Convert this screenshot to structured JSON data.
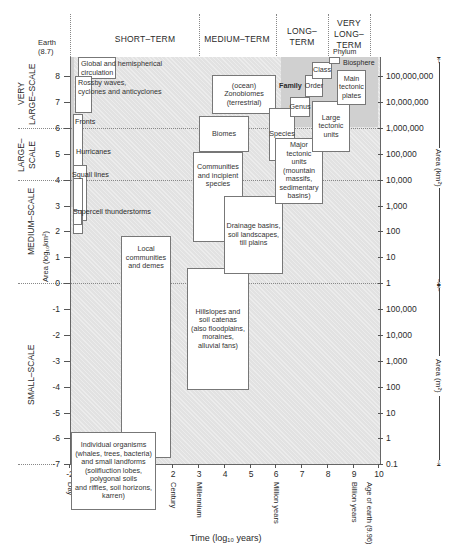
{
  "periods": [
    {
      "label": "SHORT–TERM"
    },
    {
      "label": "MEDIUM–TERM"
    },
    {
      "label": "LONG–\nTERM"
    },
    {
      "label": "VERY\nLONG–\nTERM"
    }
  ],
  "spatial_scales": [
    {
      "label": "VERY\nLARGE–SCALE"
    },
    {
      "label": "LARGE–\nSCALE"
    },
    {
      "label": "MEDIUM–SCALE"
    },
    {
      "label": "SMALL–SCALE"
    }
  ],
  "y_axis": {
    "label": "Area (log₁₀km²)",
    "top_marker": "Earth\n(8.7)",
    "ticks": [
      "8",
      "7",
      "6",
      "5",
      "4",
      "3",
      "2",
      "1",
      "0",
      "-1",
      "-2",
      "-3",
      "-4",
      "-5",
      "-6",
      "-7"
    ]
  },
  "x_axis": {
    "label": "Time (log₁₀ years)",
    "ticks": [
      "-2",
      "-1",
      "0",
      "1",
      "2",
      "3",
      "4",
      "5",
      "6",
      "7",
      "8",
      "9",
      "10"
    ],
    "named": [
      {
        "value": -2,
        "label": "Day"
      },
      {
        "value": -1,
        "label": "Month"
      },
      {
        "value": 0,
        "label": "Year"
      },
      {
        "value": 1,
        "label": "Decade"
      },
      {
        "value": 2,
        "label": "Century"
      },
      {
        "value": 3,
        "label": "Millennium"
      },
      {
        "value": 6,
        "label": "Million years"
      },
      {
        "value": 9,
        "label": "Billion years"
      },
      {
        "value": 9.6,
        "label": "Age of earth (9.96)"
      }
    ]
  },
  "right_axis": {
    "km2_label": "Area (km²)",
    "m2_label": "Area (m²)",
    "km2_ticks": [
      "100,000,000",
      "10,000,000",
      "1,000,000",
      "100,000",
      "10,000",
      "1,000",
      "100",
      "10",
      "1"
    ],
    "m2_ticks": [
      "100,000",
      "10,000",
      "1,000",
      "100",
      "10",
      "1",
      "0.1"
    ]
  },
  "boxes": {
    "global": "Global and hemispherical\ncirculation",
    "rossby": "Rossby waves,\ncyclones and anticyclones",
    "fronts": "Fronts",
    "hurricanes": "Hurricanes",
    "squall": "Squall lines",
    "supercell": "Supercell thunderstorms",
    "zonobiomes": "(ocean)\nZonobiomes\n(terrestrial)",
    "biomes": "Biomes",
    "communities": "Communities\nand incipient\nspecies",
    "drainage": "Drainage basins,\nsoil landscapes,\ntill plains",
    "local": "Local\ncommunities\nand demes",
    "hillslopes": "Hillslopes and\nsoil catenas\n(also floodplains,\nmoraines,\nalluvial fans)",
    "individual": "Individual organisms\n(whales, trees, bacteria)\nand small landforms\n(solifluction lobes,\npolygonal soils\nand riffles, soil horizons,\nkarren)",
    "family": "Family",
    "order": "Order",
    "class": "Class",
    "phylum": "Phylum",
    "biosphere": "Biosphere",
    "genus": "Genus",
    "species": "Species",
    "main_plates": "Main\ntectonic\nplates",
    "large_tectonic": "Large\ntectonic\nunits",
    "major_tectonic": "Major\ntectonic\nunits\n(mountain\nmassifs,\nsedimentary\nbasins)"
  },
  "colors": {
    "background_fill": "#e2e2e2",
    "box_fill": "#ffffff",
    "line": "#555555"
  }
}
